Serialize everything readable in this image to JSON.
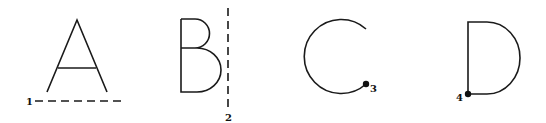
{
  "figure": {
    "stroke_color": "#1a1a1a",
    "background": "#ffffff",
    "items": [
      {
        "letter": "A",
        "marker": "dashed-horizontal-line",
        "label": "1"
      },
      {
        "letter": "B",
        "marker": "dashed-vertical-line",
        "label": "2"
      },
      {
        "letter": "C",
        "marker": "dot",
        "label": "3"
      },
      {
        "letter": "D",
        "marker": "dot",
        "label": "4"
      }
    ]
  }
}
